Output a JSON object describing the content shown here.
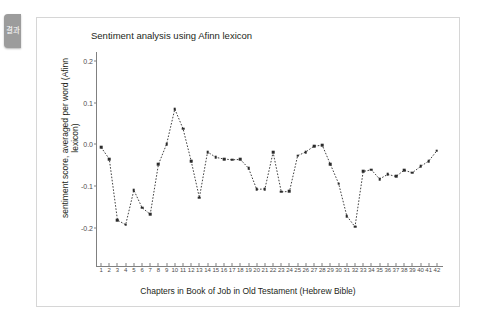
{
  "side_tab": {
    "label": "결과",
    "icon": "panel-tab-icon",
    "color": "#9c9c9c"
  },
  "panel": {
    "border_color": "#d6d6d6",
    "background": "#ffffff"
  },
  "chart_data": {
    "type": "line",
    "title": "Sentiment analysis using Afinn lexicon",
    "xlabel": "Chapters in Book of Job in Old Testament (Hebrew Bible)",
    "ylabel": "sentiment score, averaged per word (Afinn lexicon)",
    "grid": false,
    "legend": null,
    "line_style": "dashed",
    "marker": "point",
    "color": "#2b2b2b",
    "xlim": [
      0.5,
      42.5
    ],
    "ylim": [
      -0.285,
      0.215
    ],
    "ytick_labels": [
      "0.2",
      "0.1",
      "0.0",
      "-0.1",
      "-0.2"
    ],
    "yticks": [
      0.2,
      0.1,
      0.0,
      -0.1,
      -0.2
    ],
    "categories": [
      1,
      2,
      3,
      4,
      5,
      6,
      7,
      8,
      9,
      10,
      11,
      12,
      13,
      14,
      15,
      16,
      17,
      18,
      19,
      20,
      21,
      22,
      23,
      24,
      25,
      26,
      27,
      28,
      29,
      30,
      31,
      32,
      33,
      34,
      35,
      36,
      37,
      38,
      39,
      40,
      41,
      42
    ],
    "xtick_labels": [
      "1",
      "2",
      "3",
      "4",
      "5",
      "6",
      "7",
      "8",
      "9",
      "10",
      "11",
      "12",
      "13",
      "14",
      "15",
      "16",
      "17",
      "18",
      "19",
      "20",
      "21",
      "22",
      "23",
      "24",
      "25",
      "26",
      "27",
      "28",
      "29",
      "30",
      "31",
      "32",
      "33",
      "34",
      "35",
      "36",
      "37",
      "38",
      "39",
      "40",
      "41",
      "42"
    ],
    "values": [
      -0.007,
      -0.035,
      -0.182,
      -0.193,
      -0.11,
      -0.152,
      -0.168,
      -0.048,
      0.001,
      0.085,
      0.038,
      -0.04,
      -0.128,
      -0.018,
      -0.031,
      -0.035,
      -0.037,
      -0.036,
      -0.057,
      -0.108,
      -0.107,
      -0.019,
      -0.114,
      -0.113,
      -0.027,
      -0.018,
      -0.004,
      -0.002,
      -0.048,
      -0.094,
      -0.172,
      -0.198,
      -0.065,
      -0.061,
      -0.083,
      -0.072,
      -0.077,
      -0.062,
      -0.068,
      -0.053,
      -0.04,
      -0.015
    ],
    "series": [
      {
        "name": "afinn sentiment",
        "values": [
          -0.007,
          -0.035,
          -0.182,
          -0.193,
          -0.11,
          -0.152,
          -0.168,
          -0.048,
          0.001,
          0.085,
          0.038,
          -0.04,
          -0.128,
          -0.018,
          -0.031,
          -0.035,
          -0.037,
          -0.036,
          -0.057,
          -0.108,
          -0.107,
          -0.019,
          -0.114,
          -0.113,
          -0.027,
          -0.018,
          -0.004,
          -0.002,
          -0.048,
          -0.094,
          -0.172,
          -0.198,
          -0.065,
          -0.061,
          -0.083,
          -0.072,
          -0.077,
          -0.062,
          -0.068,
          -0.053,
          -0.04,
          -0.015
        ]
      }
    ],
    "points": [
      {
        "x": 1,
        "y": -0.007
      },
      {
        "x": 2,
        "y": -0.035
      },
      {
        "x": 3,
        "y": -0.182
      },
      {
        "x": 4,
        "y": -0.193
      },
      {
        "x": 5,
        "y": -0.11
      },
      {
        "x": 6,
        "y": -0.152
      },
      {
        "x": 7,
        "y": -0.168
      },
      {
        "x": 8,
        "y": -0.048
      },
      {
        "x": 9,
        "y": 0.001
      },
      {
        "x": 10,
        "y": 0.085
      },
      {
        "x": 11,
        "y": 0.038
      },
      {
        "x": 12,
        "y": -0.04
      },
      {
        "x": 13,
        "y": -0.128
      },
      {
        "x": 14,
        "y": -0.018
      },
      {
        "x": 15,
        "y": -0.031
      },
      {
        "x": 16,
        "y": -0.035
      },
      {
        "x": 17,
        "y": -0.037
      },
      {
        "x": 18,
        "y": -0.036
      },
      {
        "x": 19,
        "y": -0.057
      },
      {
        "x": 20,
        "y": -0.108
      },
      {
        "x": 21,
        "y": -0.107
      },
      {
        "x": 22,
        "y": -0.019
      },
      {
        "x": 23,
        "y": -0.114
      },
      {
        "x": 24,
        "y": -0.113
      },
      {
        "x": 25,
        "y": -0.027
      },
      {
        "x": 26,
        "y": -0.018
      },
      {
        "x": 27,
        "y": -0.004
      },
      {
        "x": 28,
        "y": -0.002
      },
      {
        "x": 29,
        "y": -0.048
      },
      {
        "x": 30,
        "y": -0.094
      },
      {
        "x": 31,
        "y": -0.172
      },
      {
        "x": 32,
        "y": -0.198
      },
      {
        "x": 33,
        "y": -0.065
      },
      {
        "x": 34,
        "y": -0.061
      },
      {
        "x": 35,
        "y": -0.083
      },
      {
        "x": 36,
        "y": -0.072
      },
      {
        "x": 37,
        "y": -0.077
      },
      {
        "x": 38,
        "y": -0.062
      },
      {
        "x": 39,
        "y": -0.068
      },
      {
        "x": 40,
        "y": -0.053
      },
      {
        "x": 41,
        "y": -0.04
      },
      {
        "x": 42,
        "y": -0.015
      }
    ]
  }
}
